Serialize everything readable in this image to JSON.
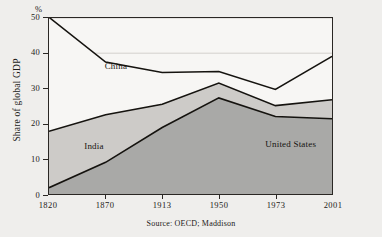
{
  "chart_data": {
    "type": "area",
    "stacked": true,
    "title": "",
    "subtitle": "",
    "xlabel": "",
    "ylabel": "Share of global GDP",
    "unit_label": "%",
    "categories": [
      "1820",
      "1870",
      "1913",
      "1950",
      "1973",
      "2001"
    ],
    "x": [
      1820,
      1870,
      1913,
      1950,
      1973,
      2001
    ],
    "ylim": [
      0,
      50
    ],
    "yticks": [
      0,
      10,
      20,
      30,
      40,
      50
    ],
    "ytick_labels": [
      "0",
      "10",
      "20",
      "30",
      "40",
      "50"
    ],
    "grid": true,
    "legend": "in-plot-labels",
    "series": [
      {
        "name": "United States",
        "color": "#a9a9a7",
        "stack_order": 1,
        "values": [
          1.8,
          9.0,
          18.9,
          27.3,
          22.0,
          21.4
        ]
      },
      {
        "name": "India",
        "color": "#cdcbc8",
        "stack_order": 2,
        "values": [
          16.0,
          13.5,
          6.6,
          4.2,
          3.1,
          5.4
        ]
      },
      {
        "name": "China",
        "color": "#f7f6f4",
        "stack_order": 3,
        "values": [
          32.4,
          15.0,
          9.0,
          3.3,
          4.6,
          12.3
        ]
      }
    ],
    "cumulative_tops": {
      "united_states": [
        1.8,
        9.0,
        18.9,
        27.3,
        22.0,
        21.4
      ],
      "india": [
        17.8,
        22.5,
        25.5,
        31.5,
        25.1,
        26.8
      ],
      "china": [
        50.2,
        37.5,
        34.5,
        34.8,
        29.7,
        39.1
      ]
    },
    "annotations": [
      {
        "text": "China",
        "x": 1856,
        "y": 36.0
      },
      {
        "text": "India",
        "x": 1843,
        "y": 13.5
      },
      {
        "text": "United States",
        "x": 1958,
        "y": 14.0
      }
    ],
    "source": "Source: OECD; Maddison"
  },
  "axes": {
    "y_title": "Share of global GDP",
    "percent_symbol": "%"
  },
  "colors": {
    "background": "#efeeec",
    "plot_background": "#f7f6f4",
    "axis": "#2a2724",
    "gridline": "#c8c6c2",
    "series_line": "#15130f",
    "united_states_fill": "#a9a9a7",
    "india_fill": "#cdcbc8",
    "china_fill": "#f7f6f4"
  }
}
